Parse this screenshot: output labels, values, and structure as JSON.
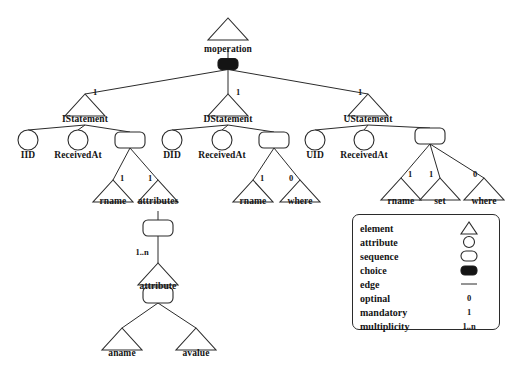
{
  "diagram": {
    "colors": {
      "stroke": "#2b2b2b",
      "fill": "#ffffff",
      "choice_fill": "#141414",
      "text": "#151515"
    },
    "nodes": [
      {
        "id": "moperation",
        "label": "moperation",
        "kind": "element",
        "x": 228,
        "y": 18,
        "label_x": 228,
        "label_y": 44
      },
      {
        "id": "root_choice",
        "label": "",
        "kind": "choice",
        "x": 228,
        "y": 64
      },
      {
        "id": "IStatement",
        "label": "IStatement",
        "kind": "element",
        "x": 85,
        "y": 94,
        "label_x": 85,
        "label_y": 114,
        "mult": "1",
        "mult_x": 95,
        "mult_y": 92
      },
      {
        "id": "DStatement",
        "label": "DStatement",
        "kind": "element",
        "x": 228,
        "y": 94,
        "label_x": 228,
        "label_y": 114,
        "mult": "1",
        "mult_x": 238,
        "mult_y": 92
      },
      {
        "id": "UStatement",
        "label": "UStatement",
        "kind": "element",
        "x": 368,
        "y": 94,
        "label_x": 368,
        "label_y": 114,
        "mult": "1",
        "mult_x": 360,
        "mult_y": 92
      },
      {
        "id": "IID",
        "label": "IID",
        "kind": "attribute",
        "x": 28,
        "y": 140,
        "label_x": 28,
        "label_y": 150
      },
      {
        "id": "I_ReceivedAt",
        "label": "ReceivedAt",
        "kind": "attribute",
        "x": 78,
        "y": 140,
        "label_x": 78,
        "label_y": 150
      },
      {
        "id": "I_seq",
        "label": "",
        "kind": "sequence",
        "x": 130,
        "y": 140
      },
      {
        "id": "I_rname",
        "label": "rname",
        "kind": "element",
        "x": 113,
        "y": 180,
        "label_x": 113,
        "label_y": 196,
        "mult": "1",
        "mult_x": 122,
        "mult_y": 178
      },
      {
        "id": "I_attributes",
        "label": "attributes",
        "kind": "element",
        "x": 158,
        "y": 180,
        "label_x": 158,
        "label_y": 196,
        "mult": "1",
        "mult_x": 150,
        "mult_y": 178
      },
      {
        "id": "attributes_seq",
        "label": "",
        "kind": "sequence",
        "x": 158,
        "y": 228
      },
      {
        "id": "attribute",
        "label": "attribute",
        "kind": "element",
        "x": 158,
        "y": 263,
        "label_x": 158,
        "label_y": 281,
        "mult": "1..n",
        "mult_x": 142,
        "mult_y": 252
      },
      {
        "id": "attribute_seq",
        "label": "",
        "kind": "sequence",
        "x": 158,
        "y": 295
      },
      {
        "id": "aname",
        "label": "aname",
        "kind": "element",
        "x": 122,
        "y": 328,
        "label_x": 122,
        "label_y": 348
      },
      {
        "id": "avalue",
        "label": "avalue",
        "kind": "element",
        "x": 196,
        "y": 328,
        "label_x": 196,
        "label_y": 348
      },
      {
        "id": "DID",
        "label": "DID",
        "kind": "attribute",
        "x": 172,
        "y": 140,
        "label_x": 172,
        "label_y": 150
      },
      {
        "id": "D_ReceivedAt",
        "label": "ReceivedAt",
        "kind": "attribute",
        "x": 222,
        "y": 140,
        "label_x": 222,
        "label_y": 150
      },
      {
        "id": "D_seq",
        "label": "",
        "kind": "sequence",
        "x": 274,
        "y": 140
      },
      {
        "id": "D_rname",
        "label": "rname",
        "kind": "element",
        "x": 253,
        "y": 180,
        "label_x": 253,
        "label_y": 196,
        "mult": "1",
        "mult_x": 262,
        "mult_y": 178
      },
      {
        "id": "D_where",
        "label": "where",
        "kind": "element",
        "x": 300,
        "y": 180,
        "label_x": 300,
        "label_y": 196,
        "mult": "0",
        "mult_x": 291,
        "mult_y": 178
      },
      {
        "id": "UID",
        "label": "UID",
        "kind": "attribute",
        "x": 315,
        "y": 140,
        "label_x": 315,
        "label_y": 150
      },
      {
        "id": "U_ReceivedAt",
        "label": "ReceivedAt",
        "kind": "attribute",
        "x": 364,
        "y": 140,
        "label_x": 364,
        "label_y": 150
      },
      {
        "id": "U_seq",
        "label": "",
        "kind": "sequence",
        "x": 430,
        "y": 136
      },
      {
        "id": "U_rname",
        "label": "rname",
        "kind": "element",
        "x": 401,
        "y": 178,
        "label_x": 401,
        "label_y": 196,
        "mult": "1",
        "mult_x": 410,
        "mult_y": 174
      },
      {
        "id": "U_set",
        "label": "set",
        "kind": "element",
        "x": 440,
        "y": 178,
        "label_x": 440,
        "label_y": 196,
        "mult": "1",
        "mult_x": 431,
        "mult_y": 174
      },
      {
        "id": "U_where",
        "label": "where",
        "kind": "element",
        "x": 484,
        "y": 178,
        "label_x": 484,
        "label_y": 196,
        "mult": "0",
        "mult_x": 475,
        "mult_y": 174
      }
    ],
    "edges": [
      {
        "from": "moperation",
        "to": "root_choice"
      },
      {
        "from": "root_choice",
        "to": "IStatement"
      },
      {
        "from": "root_choice",
        "to": "DStatement"
      },
      {
        "from": "root_choice",
        "to": "UStatement"
      },
      {
        "from": "IStatement",
        "to": "IID"
      },
      {
        "from": "IStatement",
        "to": "I_ReceivedAt"
      },
      {
        "from": "IStatement",
        "to": "I_seq"
      },
      {
        "from": "I_seq",
        "to": "I_rname"
      },
      {
        "from": "I_seq",
        "to": "I_attributes"
      },
      {
        "from": "I_attributes",
        "to": "attributes_seq"
      },
      {
        "from": "attributes_seq",
        "to": "attribute"
      },
      {
        "from": "attribute",
        "to": "attribute_seq"
      },
      {
        "from": "attribute_seq",
        "to": "aname"
      },
      {
        "from": "attribute_seq",
        "to": "avalue"
      },
      {
        "from": "DStatement",
        "to": "DID"
      },
      {
        "from": "DStatement",
        "to": "D_ReceivedAt"
      },
      {
        "from": "DStatement",
        "to": "D_seq"
      },
      {
        "from": "D_seq",
        "to": "D_rname"
      },
      {
        "from": "D_seq",
        "to": "D_where"
      },
      {
        "from": "UStatement",
        "to": "UID"
      },
      {
        "from": "UStatement",
        "to": "U_ReceivedAt"
      },
      {
        "from": "UStatement",
        "to": "U_seq"
      },
      {
        "from": "U_seq",
        "to": "U_rname"
      },
      {
        "from": "U_seq",
        "to": "U_set"
      },
      {
        "from": "U_seq",
        "to": "U_where"
      }
    ]
  },
  "legend": {
    "rows": [
      {
        "label": "element",
        "symbol": "triangle",
        "value": ""
      },
      {
        "label": "attribute",
        "symbol": "circle",
        "value": ""
      },
      {
        "label": "sequence",
        "symbol": "roundrect",
        "value": ""
      },
      {
        "label": "choice",
        "symbol": "filled",
        "value": ""
      },
      {
        "label": "edge",
        "symbol": "line",
        "value": ""
      },
      {
        "label": "optinal",
        "symbol": "text",
        "value": "0"
      },
      {
        "label": "mandatory",
        "symbol": "text",
        "value": "1"
      },
      {
        "label": "multiplicity",
        "symbol": "text",
        "value": "1..n"
      }
    ]
  }
}
